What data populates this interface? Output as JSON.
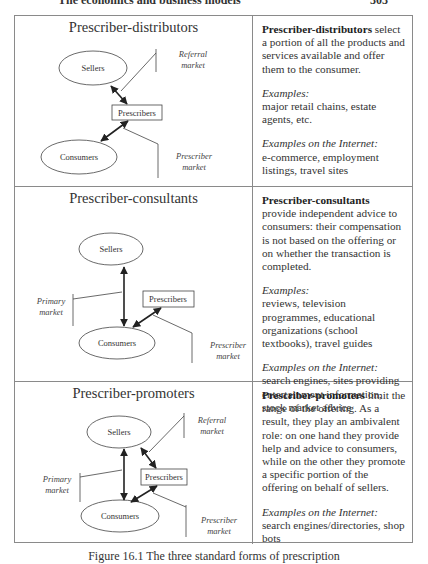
{
  "running_head": {
    "title": "The economics and business models",
    "page_number": "303"
  },
  "figure": {
    "caption": "Figure 16.1  The three standard forms of prescription",
    "rows": [
      {
        "id": "distributors",
        "title": "Prescriber-distributors",
        "diagram": {
          "sellers": "Sellers",
          "prescribers": "Prescribers",
          "consumers": "Consumers",
          "referral_market": [
            "Referral",
            "market"
          ],
          "prescriber_market": [
            "Prescriber",
            "market"
          ]
        },
        "description_term": "Prescriber-distributors",
        "description_rest": " select a portion of all the products and services available and offer them to the consumer.",
        "examples_label": "Examples",
        "examples": "major retail chains, estate agents, etc.",
        "internet_label": "Examples on the Internet",
        "internet_examples": "e-commerce, employment listings, travel sites"
      },
      {
        "id": "consultants",
        "title": "Prescriber-consultants",
        "diagram": {
          "sellers": "Sellers",
          "prescribers": "Prescribers",
          "consumers": "Consumers",
          "primary_market": [
            "Primary",
            "market"
          ],
          "prescriber_market": [
            "Prescriber",
            "market"
          ]
        },
        "description_term": "Prescriber-consultants",
        "description_rest": " provide independent advice to consumers: their compensation is not based on the offering or on whether the transaction is completed.",
        "examples_label": "Examples",
        "examples": "reviews, television programmes, educational organizations (school textbooks), travel guides",
        "internet_label": "Examples on the Internet",
        "internet_examples": "search engines, sites providing entertainment information, stock market advice"
      },
      {
        "id": "promoters",
        "title": "Prescriber-promoters",
        "diagram": {
          "sellers": "Sellers",
          "prescribers": "Prescribers",
          "consumers": "Consumers",
          "referral_market": [
            "Referral",
            "market"
          ],
          "primary_market": [
            "Primary",
            "market"
          ],
          "prescriber_market": [
            "Prescriber",
            "market"
          ]
        },
        "description_term": "Prescriber-promoters",
        "description_rest": " limit the range of the offering. As a result, they play an ambivalent role: on one hand they provide help and advice to consumers, while on the other they promote a specific portion of the offering on behalf of sellers.",
        "internet_label": "Examples on the Internet",
        "internet_examples": "search engines/directories, shop bots"
      }
    ]
  }
}
